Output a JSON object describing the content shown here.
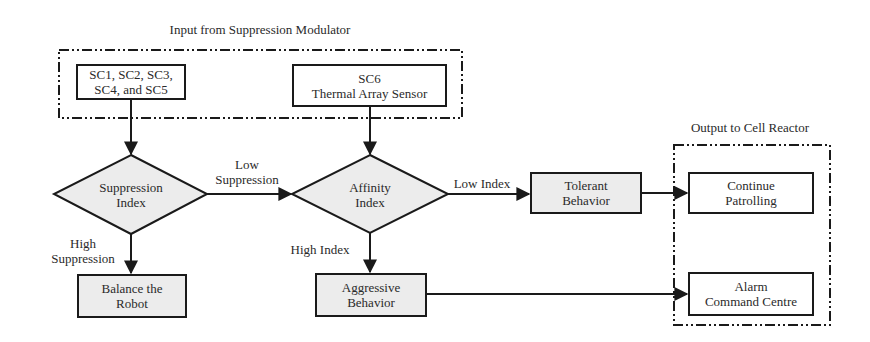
{
  "diagram": {
    "input_group": {
      "title": "Input from Suppression Modulator",
      "boxes": [
        {
          "id": "sc1_5",
          "lines": [
            "SC1, SC2, SC3,",
            "SC4, and SC5"
          ]
        },
        {
          "id": "sc6",
          "lines": [
            "SC6",
            "Thermal Array Sensor"
          ]
        }
      ]
    },
    "decisions": [
      {
        "id": "suppression_index",
        "lines": [
          "Suppression",
          "Index"
        ]
      },
      {
        "id": "affinity_index",
        "lines": [
          "Affinity",
          "Index"
        ]
      }
    ],
    "processes": [
      {
        "id": "balance_robot",
        "lines": [
          "Balance the",
          "Robot"
        ]
      },
      {
        "id": "aggressive",
        "lines": [
          "Aggressive",
          "Behavior"
        ]
      },
      {
        "id": "tolerant",
        "lines": [
          "Tolerant",
          "Behavior"
        ]
      }
    ],
    "output_group": {
      "title": "Output to Cell Reactor",
      "boxes": [
        {
          "id": "continue",
          "lines": [
            "Continue",
            "Patrolling"
          ]
        },
        {
          "id": "alarm",
          "lines": [
            "Alarm",
            "Command Centre"
          ]
        }
      ]
    },
    "edge_labels": {
      "low_suppression": [
        "Low",
        "Suppression"
      ],
      "high_suppression": [
        "High",
        "Suppression"
      ],
      "low_index": "Low Index",
      "high_index": "High Index"
    },
    "edges": [
      {
        "from": "sc1_5",
        "to": "suppression_index",
        "label": ""
      },
      {
        "from": "sc6",
        "to": "affinity_index",
        "label": ""
      },
      {
        "from": "suppression_index",
        "to": "affinity_index",
        "label": "Low Suppression"
      },
      {
        "from": "suppression_index",
        "to": "balance_robot",
        "label": "High Suppression"
      },
      {
        "from": "affinity_index",
        "to": "tolerant",
        "label": "Low Index"
      },
      {
        "from": "affinity_index",
        "to": "aggressive",
        "label": "High Index"
      },
      {
        "from": "tolerant",
        "to": "continue",
        "label": ""
      },
      {
        "from": "aggressive",
        "to": "alarm",
        "label": ""
      }
    ],
    "colors": {
      "stroke": "#1a1a1a",
      "fill_grey": "#ececec",
      "fill_white": "#ffffff",
      "text": "#2a2a2a"
    }
  }
}
